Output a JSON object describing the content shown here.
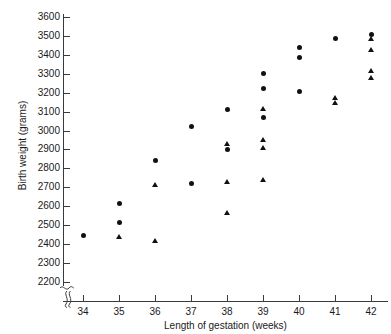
{
  "chart_data": {
    "type": "scatter",
    "title": "",
    "xlabel": "Length of gestation (weeks)",
    "ylabel": "Birth weight (grams)",
    "xlim": [
      33.5,
      42.6
    ],
    "ylim": [
      2200,
      3600
    ],
    "xticks": [
      34,
      35,
      36,
      37,
      38,
      39,
      40,
      41,
      42
    ],
    "yticks": [
      2200,
      2300,
      2400,
      2500,
      2600,
      2700,
      2800,
      2900,
      3000,
      3100,
      3200,
      3300,
      3400,
      3500,
      3600
    ],
    "grid": false,
    "legend": "none",
    "axis_break_y": true,
    "marker_color": "#111111",
    "series": [
      {
        "name": "circle",
        "marker": "circle",
        "points": [
          [
            34,
            2445
          ],
          [
            35,
            2613
          ],
          [
            35,
            2510
          ],
          [
            36,
            2840
          ],
          [
            37,
            3020
          ],
          [
            37,
            2720
          ],
          [
            38,
            3110
          ],
          [
            38,
            2900
          ],
          [
            39,
            3300
          ],
          [
            39,
            3225
          ],
          [
            39,
            3070
          ],
          [
            40,
            3440
          ],
          [
            40,
            3385
          ],
          [
            40,
            3205
          ],
          [
            41,
            3490
          ],
          [
            42,
            3510
          ]
        ]
      },
      {
        "name": "triangle",
        "marker": "triangle",
        "points": [
          [
            35,
            2435
          ],
          [
            36,
            2710
          ],
          [
            36,
            2415
          ],
          [
            38,
            2930
          ],
          [
            38,
            2725
          ],
          [
            38,
            2565
          ],
          [
            39,
            3115
          ],
          [
            39,
            2950
          ],
          [
            39,
            2910
          ],
          [
            39,
            2740
          ],
          [
            41,
            3175
          ],
          [
            41,
            3145
          ],
          [
            42,
            3485
          ],
          [
            42,
            3425
          ],
          [
            42,
            3315
          ],
          [
            42,
            3280
          ]
        ]
      }
    ]
  }
}
